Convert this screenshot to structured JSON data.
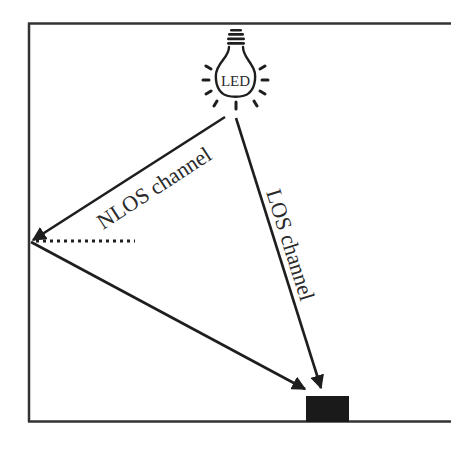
{
  "diagram": {
    "type": "vlc-channel-model",
    "source": {
      "label": "LED"
    },
    "channels": [
      {
        "id": "nlos",
        "label": "NLOS channel"
      },
      {
        "id": "los",
        "label": "LOS channel"
      }
    ],
    "receiver": {
      "label": ""
    },
    "colors": {
      "stroke": "#2a2a2a",
      "receiver_fill": "#1a1a1a",
      "background": "#ffffff"
    }
  }
}
